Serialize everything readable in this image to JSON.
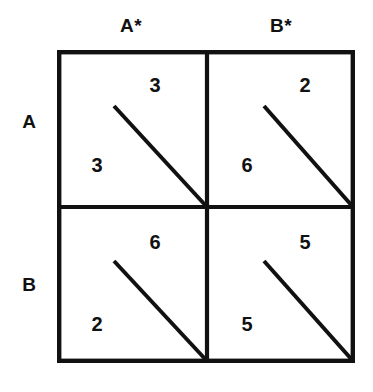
{
  "figure": {
    "type": "payoff-matrix",
    "shape": [
      2,
      2
    ],
    "line_color": "#111111",
    "background_color": "#ffffff"
  },
  "columns": [
    {
      "id": "a-star",
      "label": "A*"
    },
    {
      "id": "b-star",
      "label": "B*"
    }
  ],
  "rows": [
    {
      "id": "a",
      "label": "A"
    },
    {
      "id": "b",
      "label": "B"
    }
  ],
  "cells": [
    {
      "row": "A",
      "column": "A*",
      "row_payoff": "3",
      "column_payoff": "3"
    },
    {
      "row": "A",
      "column": "B*",
      "row_payoff": "6",
      "column_payoff": "2"
    },
    {
      "row": "B",
      "column": "A*",
      "row_payoff": "2",
      "column_payoff": "6"
    },
    {
      "row": "B",
      "column": "B*",
      "row_payoff": "5",
      "column_payoff": "5"
    }
  ]
}
